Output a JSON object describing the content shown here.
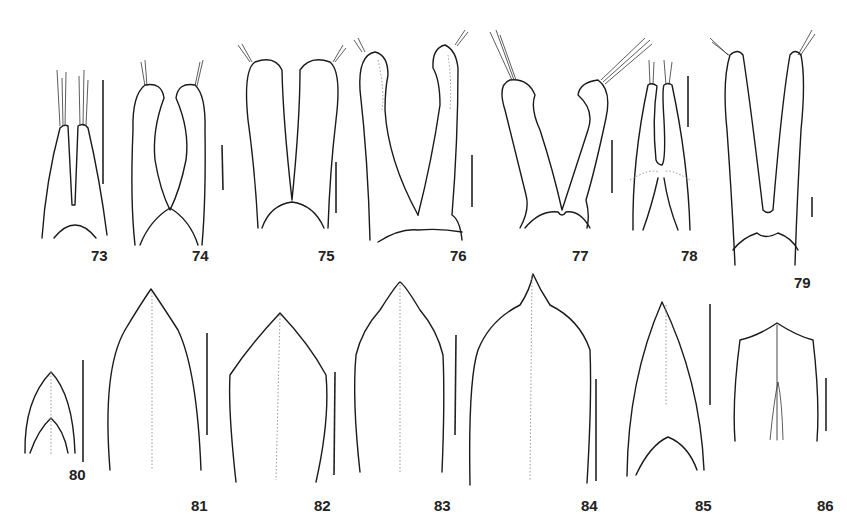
{
  "plate": {
    "description": "Line drawings of insect genital structures with scale bars",
    "figures": [
      {
        "id": "73",
        "label": "73",
        "shape": "paired narrow lobes with setal tufts"
      },
      {
        "id": "74",
        "label": "74",
        "shape": "paired club lobes meeting medially"
      },
      {
        "id": "75",
        "label": "75",
        "shape": "paired elongate lobes"
      },
      {
        "id": "76",
        "label": "76",
        "shape": "paired curved lobes"
      },
      {
        "id": "77",
        "label": "77",
        "shape": "V-shaped lobes with knob apices"
      },
      {
        "id": "78",
        "label": "78",
        "shape": "narrow paired lobes"
      },
      {
        "id": "79",
        "label": "79",
        "shape": "long V-shaped lobes"
      },
      {
        "id": "80",
        "label": "80",
        "shape": "small pointed plate"
      },
      {
        "id": "81",
        "label": "81",
        "shape": "ogival plate"
      },
      {
        "id": "82",
        "label": "82",
        "shape": "pentagonal plate"
      },
      {
        "id": "83",
        "label": "83",
        "shape": "acuminate plate"
      },
      {
        "id": "84",
        "label": "84",
        "shape": "broad acuminate plate"
      },
      {
        "id": "85",
        "label": "85",
        "shape": "triangular plate"
      },
      {
        "id": "86",
        "label": "86",
        "shape": "short plate with median apex"
      }
    ]
  }
}
